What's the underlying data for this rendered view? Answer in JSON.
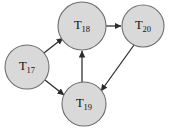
{
  "figure": {
    "type": "directed-graph",
    "background_color": "#ffffff",
    "node_fill_color": "#d9d9d9",
    "node_stroke_color": "#6e6e6e",
    "edge_color": "#2b2b2b",
    "label_color": "#111111"
  },
  "nodes": [
    {
      "id": "T17",
      "base": "T",
      "subscript": "17",
      "label": "T17",
      "cx": 27,
      "cy": 67,
      "r": 22
    },
    {
      "id": "T18",
      "base": "T",
      "subscript": "18",
      "label": "T18",
      "cx": 82,
      "cy": 26,
      "r": 24
    },
    {
      "id": "T20",
      "base": "T",
      "subscript": "20",
      "label": "T20",
      "cx": 143,
      "cy": 26,
      "r": 21
    },
    {
      "id": "T19",
      "base": "T",
      "subscript": "19",
      "label": "T19",
      "cx": 84,
      "cy": 104,
      "r": 22
    }
  ],
  "edges": [
    {
      "id": "e1",
      "from": "T17",
      "to": "T18",
      "x1": 44,
      "y1": 53,
      "x2": 63,
      "y2": 38,
      "directed": true
    },
    {
      "id": "e2",
      "from": "T17",
      "to": "T19",
      "x1": 45,
      "y1": 80,
      "x2": 64,
      "y2": 95,
      "directed": true
    },
    {
      "id": "e3",
      "from": "T19",
      "to": "T18",
      "x1": 82,
      "y1": 82,
      "x2": 82,
      "y2": 51,
      "directed": true
    },
    {
      "id": "e4",
      "from": "T18",
      "to": "T20",
      "x1": 106,
      "y1": 26,
      "x2": 121,
      "y2": 26,
      "directed": true
    },
    {
      "id": "e5",
      "from": "T20",
      "to": "T19",
      "x1": 134,
      "y1": 45,
      "x2": 100,
      "y2": 92,
      "directed": true
    }
  ]
}
